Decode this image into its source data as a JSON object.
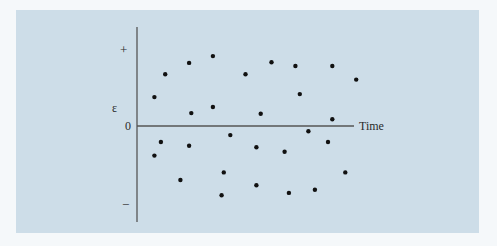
{
  "chart_data": {
    "type": "scatter",
    "title": "",
    "xlabel": "Time",
    "ylabel": "ε",
    "y_tick_labels": {
      "top": "+",
      "origin": "0",
      "bottom": "−"
    },
    "xlim": [
      0,
      1
    ],
    "ylim": [
      -1,
      1
    ],
    "grid": false,
    "legend": null,
    "note": "Residuals (ε) plotted against time, randomly scattered about zero; values normalized so +1 and −1 correspond to the + and − marks.",
    "points": [
      {
        "t": 0.08,
        "e": 0.38
      },
      {
        "t": 0.08,
        "e": -0.39
      },
      {
        "t": 0.11,
        "e": -0.21
      },
      {
        "t": 0.13,
        "e": 0.68
      },
      {
        "t": 0.2,
        "e": -0.71
      },
      {
        "t": 0.24,
        "e": 0.83
      },
      {
        "t": 0.24,
        "e": -0.26
      },
      {
        "t": 0.25,
        "e": 0.17
      },
      {
        "t": 0.35,
        "e": 0.92
      },
      {
        "t": 0.35,
        "e": 0.25
      },
      {
        "t": 0.39,
        "e": -0.91
      },
      {
        "t": 0.4,
        "e": -0.61
      },
      {
        "t": 0.43,
        "e": -0.12
      },
      {
        "t": 0.5,
        "e": 0.68
      },
      {
        "t": 0.55,
        "e": -0.78
      },
      {
        "t": 0.55,
        "e": -0.28
      },
      {
        "t": 0.57,
        "e": 0.16
      },
      {
        "t": 0.62,
        "e": 0.84
      },
      {
        "t": 0.68,
        "e": -0.34
      },
      {
        "t": 0.7,
        "e": -0.88
      },
      {
        "t": 0.73,
        "e": 0.79
      },
      {
        "t": 0.75,
        "e": 0.42
      },
      {
        "t": 0.79,
        "e": -0.07
      },
      {
        "t": 0.82,
        "e": -0.84
      },
      {
        "t": 0.88,
        "e": -0.21
      },
      {
        "t": 0.9,
        "e": 0.79
      },
      {
        "t": 0.9,
        "e": 0.09
      },
      {
        "t": 0.96,
        "e": -0.61
      },
      {
        "t": 1.01,
        "e": 0.61
      }
    ]
  },
  "colors": {
    "page_background": "#f5f8fa",
    "panel_background": "#cddde8",
    "axis": "#555555",
    "points": "#111111",
    "text": "#2b2b2b"
  },
  "labels": {
    "plus": "+",
    "epsilon": "ε",
    "zero": "0",
    "minus": "−",
    "time": "Time"
  }
}
